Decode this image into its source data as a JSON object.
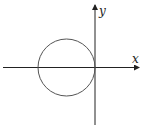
{
  "diagram": {
    "type": "coordinate-plot",
    "axes": {
      "x_label": "x",
      "y_label": "y",
      "color": "#222222"
    },
    "circle": {
      "description": "circle tangent to y-axis at origin, centered on negative x-axis",
      "cx": 66.5,
      "cy": 67.5,
      "r": 28.5,
      "stroke": "#555555"
    }
  }
}
